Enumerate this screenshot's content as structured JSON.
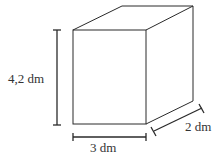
{
  "diagram": {
    "type": "rectangular-prism",
    "labels": {
      "height": "4,2 dm",
      "width": "3 dm",
      "depth": "2 dm"
    },
    "colors": {
      "stroke": "#2a2a2a",
      "text": "#333333",
      "background": "#ffffff"
    }
  }
}
